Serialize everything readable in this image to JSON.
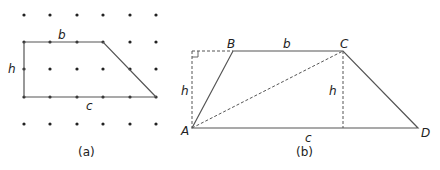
{
  "figure_a": {
    "caption": "(a)",
    "grid": {
      "columns_x": [
        24,
        50,
        77,
        103,
        130,
        156
      ],
      "rows_y": [
        15,
        42,
        69,
        97,
        124
      ],
      "dot_color": "#222222"
    },
    "shape": {
      "points": "24,42 103,42 156,97 24,97",
      "stroke": "#555555"
    },
    "labels": {
      "b": "b",
      "h": "h",
      "c": "c"
    }
  },
  "figure_b": {
    "caption": "(b)",
    "vertices": {
      "A": {
        "label": "A",
        "x": 192,
        "y": 128
      },
      "B": {
        "label": "B",
        "x": 233,
        "y": 51
      },
      "C": {
        "label": "C",
        "x": 343,
        "y": 51
      },
      "D": {
        "label": "D",
        "x": 418,
        "y": 128
      }
    },
    "labels": {
      "b": "b",
      "c": "c",
      "h_left": "h",
      "h_right": "h"
    },
    "stroke": "#555555"
  }
}
